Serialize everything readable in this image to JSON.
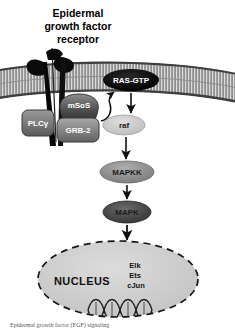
{
  "figure": {
    "title_lines": [
      "Epidermal",
      "growth factor",
      "receptor"
    ],
    "background_color": "#ffffff"
  },
  "membrane": {
    "name": "plasma-membrane",
    "fill_color": "#b8b8b8",
    "edge_color": "#4d4d4d"
  },
  "receptor": {
    "label": "EGF receptor",
    "color": "#0d0d0d"
  },
  "nodes": [
    {
      "id": "ras-gtp",
      "label": "RAS-GTP",
      "shape": "ellipse",
      "fill": "#0a0a0a",
      "text_color": "#ffffff",
      "cx": 131,
      "cy": 80,
      "rx": 28,
      "ry": 11
    },
    {
      "id": "plc-gamma",
      "label": "PLCγ",
      "shape": "rounded-rect",
      "fill": "#7d7d7d",
      "text_color": "#f2f2f2",
      "x": 22,
      "y": 110,
      "w": 32,
      "h": 26
    },
    {
      "id": "msos",
      "label": "mSoS",
      "shape": "blob",
      "fill": "#565656",
      "text_color": "#ededed",
      "cx": 79,
      "cy": 108,
      "rx": 22,
      "ry": 13
    },
    {
      "id": "grb-2",
      "label": "GRB-2",
      "shape": "rounded-rect",
      "fill": "#8a8a8a",
      "text_color": "#f5f5f5",
      "x": 57,
      "y": 118,
      "w": 42,
      "h": 24
    },
    {
      "id": "raf",
      "label": "raf",
      "shape": "ellipse",
      "fill": "#c9c9c9",
      "text_color": "#2b2b2b",
      "cx": 124,
      "cy": 125,
      "rx": 21,
      "ry": 10
    },
    {
      "id": "mapkk",
      "label": "MAPKK",
      "shape": "ellipse",
      "fill": "#8f8f8f",
      "text_color": "#111111",
      "cx": 127,
      "cy": 172,
      "rx": 27,
      "ry": 11
    },
    {
      "id": "mapk",
      "label": "MAPK",
      "shape": "ellipse",
      "fill": "#4a4a4a",
      "text_color": "#111111",
      "cx": 127,
      "cy": 212,
      "rx": 24,
      "ry": 11
    }
  ],
  "nucleus": {
    "label": "NUCLEUS",
    "fill": "#cfcfcf",
    "border_color": "#1a1a1a",
    "border_style": "dashed",
    "cx": 118,
    "cy": 279,
    "rx": 80,
    "ry": 38,
    "transcription_factors": [
      "Elk",
      "Ets",
      "cJun"
    ],
    "dna_label": "dna-double-helix"
  },
  "arrows": [
    {
      "id": "grb2-to-ras",
      "from": "grb-2",
      "to": "ras-gtp",
      "style": "curved"
    },
    {
      "id": "ras-to-raf",
      "from": "ras-gtp",
      "to": "raf",
      "style": "straight"
    },
    {
      "id": "raf-to-mapkk",
      "from": "raf",
      "to": "mapkk",
      "style": "straight"
    },
    {
      "id": "mapkk-to-mapk",
      "from": "mapkk",
      "to": "mapk",
      "style": "straight"
    },
    {
      "id": "mapk-to-nucleus",
      "from": "mapk",
      "to": "nucleus",
      "style": "straight"
    }
  ],
  "caption": {
    "text": "Epidermal growth factor (EGF) signaling"
  }
}
